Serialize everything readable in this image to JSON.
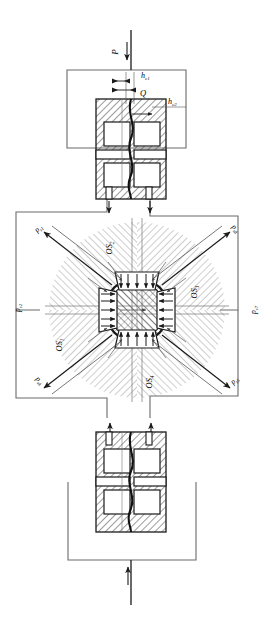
{
  "figure": {
    "type": "engineering-schematic",
    "orientation_deg": 90
  },
  "upper_assembly": {
    "name": "upper-die-assembly",
    "input_force_label": "P",
    "gap_label_top": "h",
    "gap_label_top_sub": "c1",
    "flow_label": "Q",
    "gap_label_right": "h",
    "gap_label_right_sub": "c2",
    "outlet_arrow_count": 2
  },
  "radial_hub": {
    "name": "radial-pressure-hub",
    "pad_count": 4,
    "sector_count": 4,
    "pressure_labels": [
      {
        "id": "p-upper-left",
        "base": "p",
        "sub": "s1"
      },
      {
        "id": "p-upper-right",
        "base": "p",
        "sub": "s8"
      },
      {
        "id": "p-left",
        "base": "p",
        "sub": "s2"
      },
      {
        "id": "p-right",
        "base": "p",
        "sub": "s7"
      },
      {
        "id": "p-lower-left",
        "base": "p",
        "sub": "s3"
      },
      {
        "id": "p-lower-right",
        "base": "p",
        "sub": "s6"
      },
      {
        "id": "p-bottom-left",
        "base": "p",
        "sub": "s4"
      },
      {
        "id": "p-bottom-right",
        "base": "p",
        "sub": "s5"
      }
    ],
    "sector_labels": [
      {
        "id": "os-top",
        "base": "OS",
        "sub": "2"
      },
      {
        "id": "os-right",
        "base": "OS",
        "sub": "3"
      },
      {
        "id": "os-left",
        "base": "OS",
        "sub": "1"
      },
      {
        "id": "os-bottom",
        "base": "OS",
        "sub": "4"
      }
    ]
  },
  "lower_assembly": {
    "name": "lower-die-assembly",
    "input_force_label": "",
    "inlet_arrow_count": 2,
    "return_arrow_label": ""
  },
  "colors": {
    "line": "#1a1a1a",
    "thin_line": "#555555",
    "hatch": "#444444",
    "hatch_light": "#888888",
    "background": "#ffffff"
  }
}
